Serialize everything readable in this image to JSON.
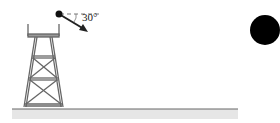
{
  "diagram": {
    "angle_label": "30°",
    "colors": {
      "stroke": "#555555",
      "ball": "#000000",
      "ground": "#cccccc"
    }
  }
}
